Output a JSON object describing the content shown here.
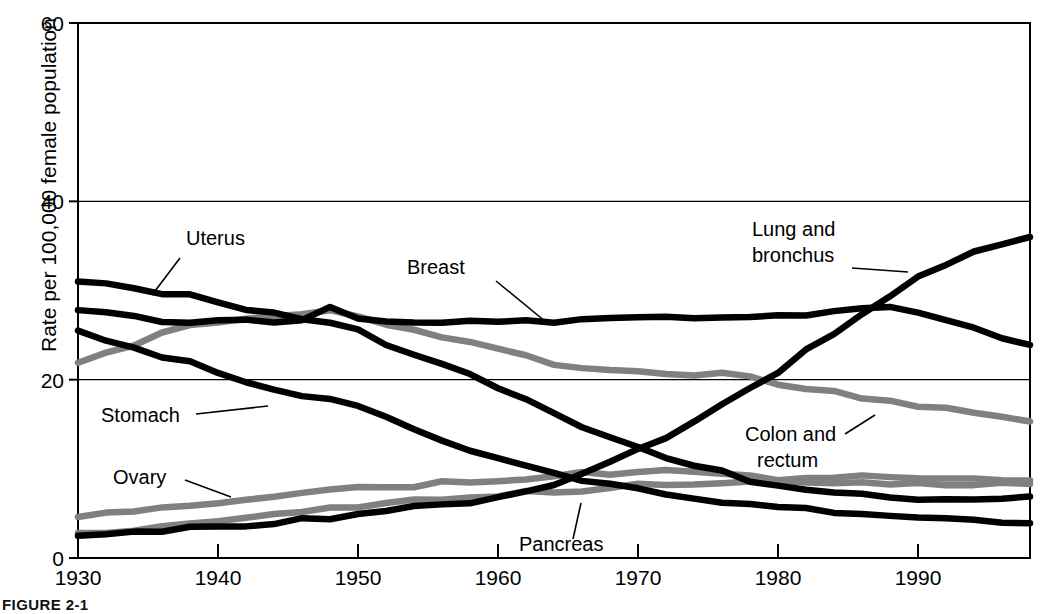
{
  "figure": {
    "caption": "FIGURE 2-1",
    "background_color": "#ffffff"
  },
  "colors": {
    "series_black": "#000000",
    "series_gray": "#808080",
    "axis": "#000000",
    "gridline": "#000000"
  },
  "axes": {
    "y": {
      "label": "Rate per 100,000 female population",
      "ticks": [
        "0",
        "20",
        "40",
        "60"
      ],
      "tick_values": [
        0,
        20,
        40,
        60
      ],
      "range": [
        0,
        60
      ]
    },
    "x": {
      "label": "",
      "ticks": [
        "1930",
        "1940",
        "1950",
        "1960",
        "1970",
        "1980",
        "1990"
      ],
      "tick_values": [
        1930,
        1940,
        1950,
        1960,
        1970,
        1980,
        1990
      ],
      "range": [
        1930,
        1998
      ]
    }
  },
  "annotations": [
    {
      "name": "uterus",
      "text": "Uterus",
      "line1": "Uterus",
      "line2": ""
    },
    {
      "name": "breast",
      "text": "Breast",
      "line1": "Breast",
      "line2": ""
    },
    {
      "name": "lung-and-bronchus",
      "text": "Lung and bronchus",
      "line1": "Lung and",
      "line2": "bronchus"
    },
    {
      "name": "stomach",
      "text": "Stomach",
      "line1": "Stomach",
      "line2": ""
    },
    {
      "name": "ovary",
      "text": "Ovary",
      "line1": "Ovary",
      "line2": ""
    },
    {
      "name": "colon-and-rectum",
      "text": "Colon and rectum",
      "line1": "Colon and",
      "line2": "rectum"
    },
    {
      "name": "pancreas",
      "text": "Pancreas",
      "line1": "Pancreas",
      "line2": ""
    }
  ],
  "chart_data": {
    "type": "line",
    "title": "",
    "subtitle": "",
    "xlabel": "",
    "ylabel": "Rate per 100,000 female population",
    "xlim": [
      1930,
      1998
    ],
    "ylim": [
      0,
      60
    ],
    "grid": "horizontal gridlines at 20 and 40",
    "legend": "inline annotations with leader lines (no legend box)",
    "x": [
      1930,
      1932,
      1934,
      1936,
      1938,
      1940,
      1942,
      1944,
      1946,
      1948,
      1950,
      1952,
      1954,
      1956,
      1958,
      1960,
      1962,
      1964,
      1966,
      1968,
      1970,
      1972,
      1974,
      1976,
      1978,
      1980,
      1982,
      1984,
      1986,
      1988,
      1990,
      1992,
      1994,
      1996,
      1998
    ],
    "series": [
      {
        "name": "Uterus",
        "color": "#000000",
        "values": [
          31.0,
          30.7,
          30.3,
          29.6,
          29.3,
          28.8,
          27.8,
          27.3,
          27.0,
          26.6,
          25.4,
          24.0,
          22.9,
          21.7,
          20.5,
          19.2,
          17.8,
          16.3,
          14.8,
          13.5,
          12.2,
          11.2,
          10.3,
          9.6,
          8.8,
          8.2,
          7.7,
          7.3,
          7.0,
          6.9,
          6.8,
          6.7,
          6.7,
          6.8,
          6.9
        ]
      },
      {
        "name": "Breast",
        "color": "#000000",
        "values": [
          27.8,
          27.3,
          26.9,
          26.6,
          26.5,
          26.4,
          26.6,
          26.5,
          26.6,
          28.4,
          26.7,
          26.6,
          26.6,
          26.5,
          26.6,
          26.4,
          26.7,
          26.6,
          26.9,
          27.0,
          27.1,
          26.9,
          27.1,
          27.0,
          27.2,
          27.1,
          27.3,
          27.5,
          27.8,
          27.9,
          27.6,
          26.9,
          25.9,
          24.9,
          23.9
        ]
      },
      {
        "name": "Stomach",
        "color": "#000000",
        "values": [
          25.5,
          24.5,
          23.6,
          22.6,
          21.8,
          20.9,
          19.6,
          18.8,
          18.3,
          17.7,
          16.8,
          15.6,
          14.4,
          13.2,
          12.2,
          11.3,
          10.4,
          9.5,
          8.8,
          8.2,
          7.7,
          7.2,
          6.8,
          6.4,
          6.0,
          5.7,
          5.4,
          5.1,
          4.8,
          4.6,
          4.4,
          4.2,
          4.1,
          4.0,
          3.9
        ]
      },
      {
        "name": "Colon and rectum",
        "color": "#808080",
        "values": [
          21.9,
          23.0,
          24.1,
          25.1,
          26.0,
          26.6,
          27.0,
          27.2,
          27.4,
          27.6,
          27.0,
          26.3,
          25.6,
          24.9,
          24.1,
          23.3,
          22.6,
          21.9,
          21.5,
          21.2,
          20.9,
          20.6,
          20.5,
          20.7,
          20.2,
          19.6,
          19.0,
          18.5,
          18.0,
          17.5,
          17.1,
          16.6,
          16.2,
          15.8,
          15.3
        ]
      },
      {
        "name": "Ovary",
        "color": "#808080",
        "values": [
          4.6,
          4.9,
          5.2,
          5.6,
          6.0,
          6.3,
          6.6,
          6.9,
          7.2,
          7.5,
          7.8,
          8.0,
          8.2,
          8.4,
          8.6,
          8.8,
          9.0,
          9.2,
          9.4,
          9.6,
          9.7,
          9.6,
          9.5,
          9.3,
          9.1,
          9.0,
          8.9,
          9.0,
          9.0,
          8.9,
          8.9,
          8.9,
          8.8,
          8.8,
          8.7
        ]
      },
      {
        "name": "Pancreas",
        "color": "#808080",
        "values": [
          2.8,
          3.0,
          3.3,
          3.6,
          3.9,
          4.2,
          4.5,
          4.8,
          5.1,
          5.4,
          5.7,
          6.0,
          6.3,
          6.6,
          6.8,
          7.0,
          7.3,
          7.5,
          7.7,
          7.9,
          8.1,
          8.2,
          8.3,
          8.4,
          8.5,
          8.5,
          8.5,
          8.5,
          8.4,
          8.4,
          8.4,
          8.4,
          8.3,
          8.3,
          8.3
        ]
      },
      {
        "name": "Lung and bronchus",
        "color": "#000000",
        "values": [
          2.5,
          2.7,
          2.9,
          3.1,
          3.3,
          3.5,
          3.7,
          3.9,
          4.2,
          4.6,
          4.9,
          5.2,
          5.6,
          6.0,
          6.4,
          6.9,
          7.6,
          8.4,
          9.4,
          10.6,
          12.0,
          13.5,
          15.2,
          17.0,
          19.0,
          21.0,
          23.2,
          25.3,
          27.5,
          29.5,
          31.5,
          33.0,
          34.2,
          35.2,
          36.0
        ]
      }
    ]
  }
}
